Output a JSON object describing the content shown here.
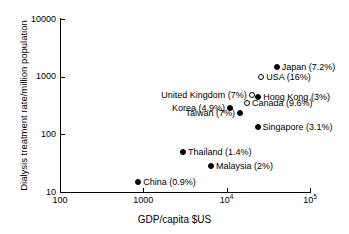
{
  "chart_data": {
    "type": "scatter",
    "title": "",
    "xlabel": "GDP/capita $US",
    "ylabel": "Dialysis treatment rate/million population",
    "xscale": "log",
    "yscale": "log",
    "xlim": [
      100,
      100000
    ],
    "ylim": [
      10,
      10000
    ],
    "grid": false,
    "legend": "none",
    "xticks": [
      {
        "value": 100,
        "label": "100"
      },
      {
        "value": 1000,
        "label": "1000"
      },
      {
        "value": 10000,
        "label": "10",
        "sup": "4"
      },
      {
        "value": 100000,
        "label": "10",
        "sup": "5"
      }
    ],
    "yticks": [
      {
        "value": 10,
        "label": "10"
      },
      {
        "value": 100,
        "label": "100"
      },
      {
        "value": 1000,
        "label": "1000"
      },
      {
        "value": 10000,
        "label": "10000"
      }
    ],
    "marker_styles": {
      "filled": "filled black circle",
      "open": "open white circle with black outline"
    },
    "points": [
      {
        "name": "Japan",
        "label": "Japan (7.2%)",
        "percent": "7.2%",
        "x": 40000,
        "y": 1450,
        "marker": "filled",
        "label_side": "right"
      },
      {
        "name": "USA",
        "label": "USA (16%)",
        "percent": "16%",
        "x": 26000,
        "y": 1000,
        "marker": "open",
        "label_side": "right"
      },
      {
        "name": "United Kingdom",
        "label": "United Kingdom (7%)",
        "percent": "7%",
        "x": 20000,
        "y": 480,
        "marker": "open",
        "label_side": "left"
      },
      {
        "name": "Hong Kong",
        "label": "Hong Kong (3%)",
        "percent": "3%",
        "x": 24000,
        "y": 440,
        "marker": "filled",
        "label_side": "right"
      },
      {
        "name": "Canada",
        "label": "Canada (9.6%)",
        "percent": "9.6%",
        "x": 17500,
        "y": 350,
        "marker": "open",
        "label_side": "right"
      },
      {
        "name": "Korea",
        "label": "Korea (4.9%)",
        "percent": "4.9%",
        "x": 11000,
        "y": 290,
        "marker": "filled",
        "label_side": "left"
      },
      {
        "name": "Taiwan",
        "label": "Taiwan (7%)",
        "percent": "7%",
        "x": 14500,
        "y": 235,
        "marker": "filled",
        "label_side": "left"
      },
      {
        "name": "Singapore",
        "label": "Singapore (3.1%)",
        "percent": "3.1%",
        "x": 23500,
        "y": 135,
        "marker": "filled",
        "label_side": "right"
      },
      {
        "name": "Thailand",
        "label": "Thailand (1.4%)",
        "percent": "1.4%",
        "x": 3000,
        "y": 50,
        "marker": "filled",
        "label_side": "right"
      },
      {
        "name": "Malaysia",
        "label": "Malaysia (2%)",
        "percent": "2%",
        "x": 6500,
        "y": 28,
        "marker": "filled",
        "label_side": "right"
      },
      {
        "name": "China",
        "label": "China (0.9%)",
        "percent": "0.9%",
        "x": 870,
        "y": 15,
        "marker": "filled",
        "label_side": "right"
      }
    ]
  }
}
